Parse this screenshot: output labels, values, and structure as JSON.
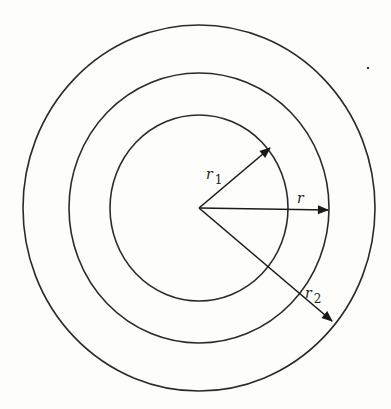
{
  "figure": {
    "type": "concentric-circles",
    "center": {
      "x": 199,
      "y": 208
    },
    "circles": [
      {
        "name": "inner",
        "rx": 89,
        "ry": 93
      },
      {
        "name": "middle",
        "rx": 130,
        "ry": 135
      },
      {
        "name": "outer",
        "rx": 176,
        "ry": 183
      }
    ],
    "vectors": [
      {
        "name": "r1",
        "label": "r",
        "subscript": "1",
        "to": {
          "x": 271,
          "y": 147
        },
        "label_pos": {
          "x": 206,
          "y": 176
        }
      },
      {
        "name": "r",
        "label": "r",
        "subscript": "",
        "to": {
          "x": 329,
          "y": 210
        },
        "label_pos": {
          "x": 297,
          "y": 202
        }
      },
      {
        "name": "r2",
        "label": "r",
        "subscript": "2",
        "to": {
          "x": 333,
          "y": 322
        },
        "label_pos": {
          "x": 305,
          "y": 298
        }
      }
    ],
    "stroke_color": "#2a2a2a",
    "background": "#fdfdfb"
  },
  "labels": {
    "r1": "r",
    "r1_sub": "1",
    "r": "r",
    "r2": "r",
    "r2_sub": "2"
  }
}
